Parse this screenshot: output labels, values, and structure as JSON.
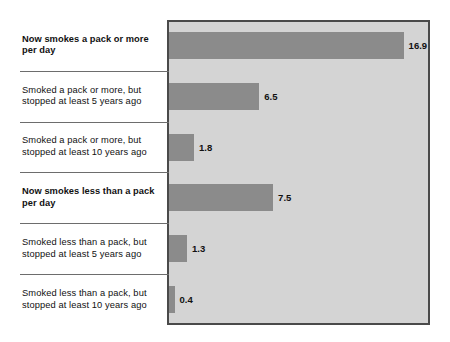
{
  "chart_data": {
    "type": "bar",
    "orientation": "horizontal",
    "title": "",
    "subtitle": "",
    "xlabel": "",
    "ylabel": "",
    "grid": false,
    "legend": null,
    "xlim": [
      0,
      18.8
    ],
    "categories": [
      "Now smokes a pack or more per day",
      "Smoked a pack or more, but stopped at least 5 years ago",
      "Smoked a pack or more, but stopped at least 10 years ago",
      "Now smokes less than a pack per day",
      "Smoked less than a pack, but stopped at least 5 years ago",
      "Smoked less than a pack, but stopped at least 10 years ago"
    ],
    "values": [
      16.9,
      6.5,
      1.8,
      7.5,
      1.3,
      0.4
    ],
    "value_labels": [
      "16.9",
      "6.5",
      "1.8",
      "7.5",
      "1.3",
      "0.4"
    ],
    "bar_color": "#8b8b8b",
    "plot_background": "#d4d4d4",
    "frame_color": "#4a4a4a"
  },
  "rows": [
    {
      "label_line1": "Now smokes a pack or more",
      "label_line2": "per day",
      "value": 16.9,
      "value_label": "16.9",
      "emphasis": true
    },
    {
      "label_line1": "Smoked a pack or more, but",
      "label_line2": "stopped at least 5 years ago",
      "value": 6.5,
      "value_label": "6.5",
      "emphasis": false
    },
    {
      "label_line1": "Smoked a pack or more, but",
      "label_line2": "stopped at least 10 years ago",
      "value": 1.8,
      "value_label": "1.8",
      "emphasis": false
    },
    {
      "label_line1": "Now smokes less than a pack",
      "label_line2": "per day",
      "value": 7.5,
      "value_label": "7.5",
      "emphasis": true
    },
    {
      "label_line1": "Smoked less than a pack, but",
      "label_line2": "stopped at least 5 years ago",
      "value": 1.3,
      "value_label": "1.3",
      "emphasis": false
    },
    {
      "label_line1": "Smoked less than a pack, but",
      "label_line2": "stopped at least 10 years ago",
      "value": 0.4,
      "value_label": "0.4",
      "emphasis": false
    }
  ]
}
